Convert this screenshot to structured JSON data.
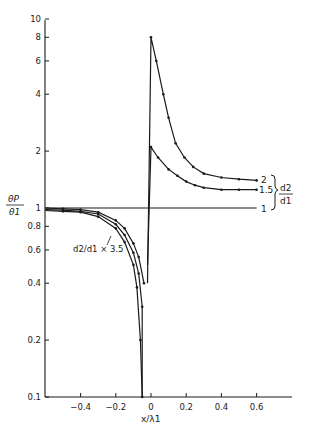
{
  "chart_data": {
    "type": "line",
    "title": "",
    "xlabel": "x/λ1",
    "ylabel_num": "θP",
    "ylabel_den": "θ1",
    "y_scale": "log",
    "ylim": [
      0.1,
      10
    ],
    "xlim": [
      -0.6,
      0.8
    ],
    "grid": false,
    "y_ticks": [
      {
        "v": 10,
        "label": "10"
      },
      {
        "v": 8,
        "label": "8"
      },
      {
        "v": 6,
        "label": "6"
      },
      {
        "v": 4,
        "label": "4"
      },
      {
        "v": 2,
        "label": "2"
      },
      {
        "v": 1,
        "label": "1"
      },
      {
        "v": 0.8,
        "label": "0.8"
      },
      {
        "v": 0.6,
        "label": "0.6"
      },
      {
        "v": 0.4,
        "label": "0.4"
      },
      {
        "v": 0.2,
        "label": "0.2"
      },
      {
        "v": 0.1,
        "label": "0.1"
      }
    ],
    "x_ticks": [
      {
        "v": -0.4,
        "label": "-0.4"
      },
      {
        "v": -0.2,
        "label": "-0.2"
      },
      {
        "v": 0,
        "label": "0"
      },
      {
        "v": 0.2,
        "label": "0.2"
      },
      {
        "v": 0.4,
        "label": "0.4"
      },
      {
        "v": 0.6,
        "label": "0.6"
      }
    ],
    "series": [
      {
        "name": "d2/d1 = 2",
        "label": "2",
        "x": [
          -0.02,
          0.0,
          0.03,
          0.07,
          0.1,
          0.14,
          0.19,
          0.24,
          0.3,
          0.4,
          0.5,
          0.6
        ],
        "y": [
          0.4,
          8.0,
          6.0,
          4.0,
          3.0,
          2.2,
          1.85,
          1.65,
          1.52,
          1.45,
          1.42,
          1.4
        ]
      },
      {
        "name": "d2/d1 = 1.5",
        "label": "1.5",
        "x": [
          -0.02,
          0.0,
          0.04,
          0.1,
          0.15,
          0.2,
          0.25,
          0.3,
          0.4,
          0.5,
          0.6
        ],
        "y": [
          0.5,
          2.1,
          1.85,
          1.6,
          1.48,
          1.38,
          1.32,
          1.28,
          1.25,
          1.25,
          1.25
        ]
      },
      {
        "name": "d2/d1 = 1",
        "label": "1",
        "x": [
          -0.6,
          0.6
        ],
        "y": [
          1.0,
          1.0
        ]
      },
      {
        "name": "d2/d1 = 2 (left branch)",
        "label": "",
        "x": [
          -0.6,
          -0.5,
          -0.4,
          -0.3,
          -0.2,
          -0.15,
          -0.1,
          -0.07,
          -0.04
        ],
        "y": [
          1.0,
          0.99,
          0.98,
          0.95,
          0.86,
          0.78,
          0.65,
          0.55,
          0.4
        ]
      },
      {
        "name": "d2/d1 = 1.5 (left branch)",
        "label": "",
        "x": [
          -0.6,
          -0.5,
          -0.4,
          -0.3,
          -0.2,
          -0.15,
          -0.1,
          -0.07,
          -0.05
        ],
        "y": [
          0.98,
          0.975,
          0.96,
          0.93,
          0.82,
          0.72,
          0.58,
          0.45,
          0.3
        ]
      },
      {
        "name": "d2/d1 = 3.5",
        "label": "d2/d1 = 3.5",
        "x": [
          -0.6,
          -0.5,
          -0.4,
          -0.3,
          -0.2,
          -0.15,
          -0.1,
          -0.08,
          -0.06,
          -0.05
        ],
        "y": [
          0.97,
          0.96,
          0.95,
          0.9,
          0.78,
          0.66,
          0.5,
          0.38,
          0.2,
          0.1
        ]
      }
    ],
    "annotations": {
      "bracket_label_num": "d2",
      "bracket_label_den": "d1",
      "curve_label_35": "d2/d1 = 3.5"
    }
  },
  "labels": {
    "y_num": "θP",
    "y_den": "θ1",
    "x_axis": "x/λ1",
    "curve_2": "2",
    "curve_15": "1.5",
    "curve_1": "1",
    "bracket_num": "d2",
    "bracket_den": "d1",
    "ann_35": "d2/d1 × 3.5"
  }
}
